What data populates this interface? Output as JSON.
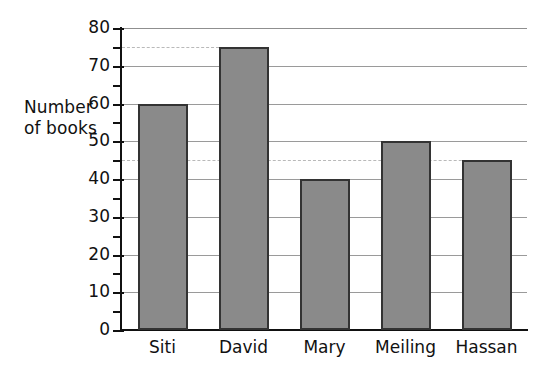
{
  "chart_data": {
    "type": "bar",
    "title": "",
    "xlabel": "",
    "ylabel": "Number\nof books",
    "categories": [
      "Siti",
      "David",
      "Mary",
      "Meiling",
      "Hassan"
    ],
    "values": [
      60,
      75,
      40,
      50,
      45
    ],
    "ylim": [
      0,
      80
    ],
    "y_major_ticks": [
      0,
      10,
      20,
      30,
      40,
      50,
      60,
      70,
      80
    ],
    "y_tick_labels": [
      "0",
      "10",
      "20",
      "30",
      "40",
      "50",
      "60",
      "70",
      "80"
    ],
    "y_minor_ticks": [
      5,
      15,
      25,
      35,
      45,
      55,
      65,
      75
    ],
    "grid": "horizontal-major-solid",
    "legend": "none",
    "annotations": [
      {
        "type": "dashed-gridline",
        "value": 75,
        "note": "dashed reader line at David's bar height, ends at David's bar"
      },
      {
        "type": "dashed-gridline",
        "value": 45,
        "note": "dashed reader line at Hassan's bar height, ends at Hassan's bar"
      }
    ],
    "colors": {
      "bar_fill": "#8a8a8a",
      "bar_stroke": "#333333",
      "gridline": "#9a9a9a",
      "dashed_gridline": "#b9b9b9",
      "axis": "#111111",
      "background": "#ffffff",
      "text": "#111111"
    }
  }
}
